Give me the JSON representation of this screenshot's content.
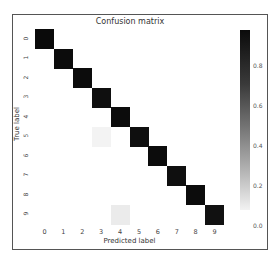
{
  "chart_data": {
    "type": "heatmap",
    "title": "Confusion matrix",
    "xlabel": "Predicted label",
    "ylabel": "True label",
    "x_ticks": [
      "0",
      "1",
      "2",
      "3",
      "4",
      "5",
      "6",
      "7",
      "8",
      "9"
    ],
    "y_ticks": [
      "0",
      "1",
      "2",
      "3",
      "4",
      "5",
      "6",
      "7",
      "8",
      "9"
    ],
    "matrix": [
      [
        0.98,
        0,
        0,
        0,
        0,
        0,
        0,
        0,
        0,
        0
      ],
      [
        0,
        0.97,
        0,
        0,
        0,
        0,
        0,
        0,
        0,
        0
      ],
      [
        0,
        0,
        0.97,
        0,
        0,
        0,
        0,
        0,
        0,
        0
      ],
      [
        0,
        0,
        0,
        0.96,
        0,
        0,
        0,
        0,
        0,
        0
      ],
      [
        0,
        0,
        0,
        0,
        0.97,
        0,
        0,
        0,
        0,
        0
      ],
      [
        0,
        0,
        0,
        0.01,
        0,
        0.96,
        0,
        0,
        0,
        0
      ],
      [
        0,
        0,
        0,
        0,
        0,
        0,
        0.97,
        0,
        0,
        0
      ],
      [
        0,
        0,
        0,
        0,
        0,
        0,
        0,
        0.96,
        0,
        0
      ],
      [
        0,
        0,
        0,
        0,
        0,
        0,
        0,
        0,
        0.97,
        0
      ],
      [
        0,
        0,
        0,
        0,
        0.04,
        0,
        0,
        0,
        0,
        0.95
      ]
    ],
    "colorbar": {
      "ticks": [
        "0.8",
        "0.6",
        "0.4",
        "0.2",
        "0.0"
      ],
      "range": [
        0,
        0.98
      ],
      "cmap": "Greys"
    },
    "grid": false
  }
}
